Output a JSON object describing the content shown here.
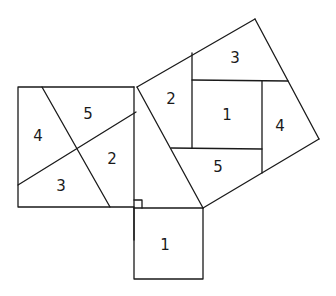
{
  "triangle": {
    "vertices": [
      [
        137,
        87
      ],
      [
        134,
        208
      ],
      [
        203,
        208
      ]
    ],
    "right_angle_marker": true
  },
  "squares": {
    "leg_vertical": {
      "description": "Square on the longer leg (left)",
      "pieces": [
        {
          "label": "4",
          "x": 38,
          "y": 136
        },
        {
          "label": "5",
          "x": 88,
          "y": 114
        },
        {
          "label": "2",
          "x": 112,
          "y": 159
        },
        {
          "label": "3",
          "x": 61,
          "y": 186
        }
      ]
    },
    "leg_horizontal": {
      "description": "Square on the shorter leg (bottom)",
      "pieces": [
        {
          "label": "1",
          "x": 165,
          "y": 245
        }
      ]
    },
    "hypotenuse": {
      "description": "Square on the hypotenuse (tilted, upper right)",
      "pieces": [
        {
          "label": "3",
          "x": 235,
          "y": 58
        },
        {
          "label": "2",
          "x": 171,
          "y": 99
        },
        {
          "label": "1",
          "x": 227,
          "y": 115
        },
        {
          "label": "4",
          "x": 280,
          "y": 126
        },
        {
          "label": "5",
          "x": 218,
          "y": 167
        }
      ]
    }
  }
}
